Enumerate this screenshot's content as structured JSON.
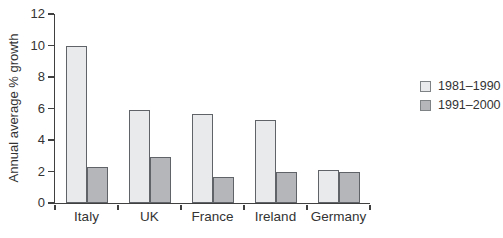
{
  "figure": {
    "background": "#ffffff"
  },
  "chart_data": {
    "type": "bar",
    "title": "",
    "xlabel": "",
    "ylabel": "Annual average % growth",
    "categories": [
      "Italy",
      "UK",
      "France",
      "Ireland",
      "Germany"
    ],
    "series": [
      {
        "name": "1981–1990",
        "color": "#e9eaec",
        "values": [
          10.0,
          5.9,
          5.65,
          5.3,
          2.1
        ]
      },
      {
        "name": "1991–2000",
        "color": "#b4b6b9",
        "values": [
          2.3,
          2.9,
          1.65,
          2.0,
          2.0
        ]
      }
    ],
    "ylim": [
      0,
      12
    ],
    "yticks": [
      0,
      2,
      4,
      6,
      8,
      10,
      12
    ],
    "grid": false,
    "legend_position": "right",
    "bar_border_color": "#606468",
    "axis_color": "#404040",
    "text_color": "#333333"
  }
}
